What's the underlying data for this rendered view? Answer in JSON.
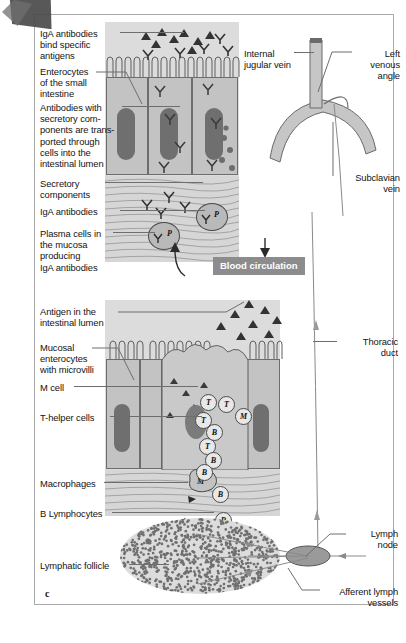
{
  "figure": {
    "panel_letter": "c",
    "center_box_label": "Blood circulation"
  },
  "upper_panel": {
    "labels_left": [
      {
        "name": "iga-antibodies-bind",
        "text": "IgA antibodies\nbind specific\nantigens"
      },
      {
        "name": "enterocytes-small-intestine",
        "text": "Enterocytes\nof the small\nintestine"
      },
      {
        "name": "antibodies-secretory-components",
        "text": "Antibodies with\nsecretory com-\nponents are trans-\nported through\ncells into the\nintestinal lumen"
      },
      {
        "name": "secretory-components",
        "text": "Secretory\ncomponents"
      },
      {
        "name": "iga-antibodies",
        "text": "IgA antibodies"
      },
      {
        "name": "plasma-cells-mucosa",
        "text": "Plasma cells in\nthe mucosa\nproducing\nIgA antibodies"
      }
    ],
    "vein_labels": [
      {
        "name": "internal-jugular-vein",
        "text": "Internal\njugular vein"
      },
      {
        "name": "left-venous-angle",
        "text": "Left\nvenous\nangle"
      },
      {
        "name": "subclavian-vein",
        "text": "Subclavian\nvein"
      }
    ],
    "plasma_cell_marks": [
      "P",
      "P"
    ]
  },
  "lower_panel": {
    "labels_left": [
      {
        "name": "antigen-intestinal-lumen",
        "text": "Antigen in the\nintestinal lumen"
      },
      {
        "name": "mucosal-enterocytes-microvilli",
        "text": "Mucosal\nenterocytes\nwith microvilli"
      },
      {
        "name": "m-cell",
        "text": "M cell"
      },
      {
        "name": "t-helper-cells",
        "text": "T-helper cells"
      },
      {
        "name": "macrophages",
        "text": "Macrophages"
      },
      {
        "name": "b-lymphocytes",
        "text": "B Lymphocytes"
      },
      {
        "name": "lymphatic-follicle",
        "text": "Lymphatic follicle"
      }
    ],
    "labels_right": [
      {
        "name": "thoracic-duct",
        "text": "Thoracic\nduct"
      },
      {
        "name": "lymph-node",
        "text": "Lymph\nnode"
      },
      {
        "name": "afferent-lymph-vessels",
        "text": "Afferent lymph\nvessels"
      }
    ],
    "cell_marks": {
      "t_cells": [
        "T",
        "T",
        "T",
        "T"
      ],
      "b_cells": [
        "B",
        "B",
        "B",
        "B",
        "B",
        "B"
      ],
      "m_cells": [
        "M",
        "M"
      ]
    }
  },
  "colors": {
    "tissue_gray": "#cfcfcf",
    "epithelium_gray": "#c3c3c3",
    "nucleus_gray": "#6f6f6f",
    "vessel_gray": "#c6c6c6",
    "box_gray": "#8c8c8c",
    "leader_line": "#6e6e6e",
    "page_border": "#a9a9a9",
    "text": "#141414"
  }
}
